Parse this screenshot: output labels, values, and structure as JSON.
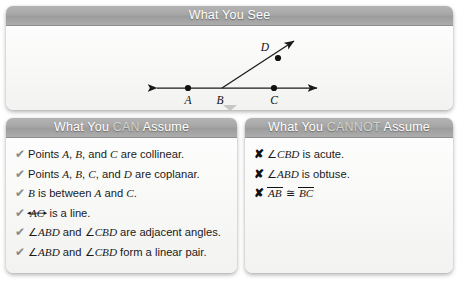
{
  "see_panel": {
    "title_prefix": "What You ",
    "title_highlight": "",
    "title_suffix": "See",
    "title_full": "What You See"
  },
  "diagram": {
    "points": [
      {
        "label": "A",
        "x": 188,
        "y": 87
      },
      {
        "label": "B",
        "x": 222,
        "y": 87
      },
      {
        "label": "C",
        "x": 274,
        "y": 87
      },
      {
        "label": "D",
        "x": 268,
        "y": 46
      }
    ],
    "line_left_end": "arrow",
    "line_right_end": "arrow",
    "ray_end": "arrow"
  },
  "can_panel": {
    "title_prefix": "What You ",
    "title_highlight": "CAN",
    "title_suffix": " Assume",
    "mark": "✔",
    "items": [
      {
        "parts": [
          {
            "t": "Points ",
            "s": "n"
          },
          {
            "t": "A",
            "s": "i"
          },
          {
            "t": ", ",
            "s": "n"
          },
          {
            "t": "B",
            "s": "i"
          },
          {
            "t": ", and ",
            "s": "n"
          },
          {
            "t": "C",
            "s": "i"
          },
          {
            "t": " are collinear.",
            "s": "n"
          }
        ]
      },
      {
        "parts": [
          {
            "t": "Points ",
            "s": "n"
          },
          {
            "t": "A",
            "s": "i"
          },
          {
            "t": ", ",
            "s": "n"
          },
          {
            "t": "B",
            "s": "i"
          },
          {
            "t": ", ",
            "s": "n"
          },
          {
            "t": "C",
            "s": "i"
          },
          {
            "t": ", and ",
            "s": "n"
          },
          {
            "t": "D",
            "s": "i"
          },
          {
            "t": " are coplanar.",
            "s": "n"
          }
        ]
      },
      {
        "parts": [
          {
            "t": "B",
            "s": "i"
          },
          {
            "t": " is between ",
            "s": "n"
          },
          {
            "t": "A",
            "s": "i"
          },
          {
            "t": " and ",
            "s": "n"
          },
          {
            "t": "C",
            "s": "i"
          },
          {
            "t": ".",
            "s": "n"
          }
        ]
      },
      {
        "parts": [
          {
            "t": "AC",
            "s": "line"
          },
          {
            "t": " is a line.",
            "s": "n"
          }
        ]
      },
      {
        "parts": [
          {
            "t": "∠",
            "s": "a"
          },
          {
            "t": "ABD",
            "s": "i"
          },
          {
            "t": " and ",
            "s": "n"
          },
          {
            "t": "∠",
            "s": "a"
          },
          {
            "t": "CBD",
            "s": "i"
          },
          {
            "t": " are adjacent angles.",
            "s": "n"
          }
        ]
      },
      {
        "parts": [
          {
            "t": "∠",
            "s": "a"
          },
          {
            "t": "ABD",
            "s": "i"
          },
          {
            "t": " and ",
            "s": "n"
          },
          {
            "t": "∠",
            "s": "a"
          },
          {
            "t": "CBD",
            "s": "i"
          },
          {
            "t": " form a linear pair.",
            "s": "n"
          }
        ]
      }
    ]
  },
  "cannot_panel": {
    "title_prefix": "What You ",
    "title_highlight": "CANNOT",
    "title_suffix": " Assume",
    "mark": "✘",
    "items": [
      {
        "parts": [
          {
            "t": "∠",
            "s": "a"
          },
          {
            "t": "CBD",
            "s": "i"
          },
          {
            "t": " is acute.",
            "s": "n"
          }
        ]
      },
      {
        "parts": [
          {
            "t": "∠",
            "s": "a"
          },
          {
            "t": "ABD",
            "s": "i"
          },
          {
            "t": " is obtuse.",
            "s": "n"
          }
        ]
      },
      {
        "parts": [
          {
            "t": "AB",
            "s": "seg"
          },
          {
            "t": " ≅ ",
            "s": "n"
          },
          {
            "t": "BC",
            "s": "seg"
          }
        ]
      }
    ]
  },
  "colors": {
    "header_gray": "#a6a6a6",
    "header_text": "#ffffff",
    "highlight_text": "#cfd2cb",
    "panel_bg": "#fbfbfa",
    "body_text": "#1a1a1a",
    "check_gray": "#8a8a8a",
    "cross_black": "#111111",
    "page_bg": "#ffffff"
  }
}
